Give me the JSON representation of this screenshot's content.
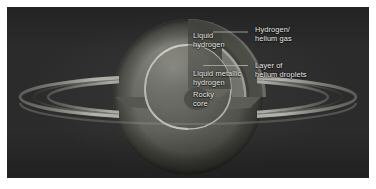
{
  "figure": {
    "background_color": "#ffffff",
    "plate_color": "#2b2b2b",
    "label_color": "#e9e9e6",
    "leader_line_color": "#d8d8d4"
  },
  "labels": {
    "liquid_hydrogen": "Liquid\nhydrogen",
    "hydrogen_helium_gas": "Hydrogen/\nhelium gas",
    "helium_droplets": "Layer of\nhelium droplets",
    "liquid_metallic_hydrogen": "Liquid metallic\nhydrogen",
    "rocky_core": "Rocky\ncore"
  },
  "diagram": {
    "planet_name": "Saturn",
    "layers": [
      {
        "name": "Hydrogen/helium gas",
        "order": 1,
        "color": "#6e6e68"
      },
      {
        "name": "Liquid hydrogen",
        "order": 2,
        "color": "#565650"
      },
      {
        "name": "Layer of helium droplets",
        "order": 3,
        "color": "#b9b9b0"
      },
      {
        "name": "Liquid metallic hydrogen",
        "order": 4,
        "color": "#8e8e85"
      },
      {
        "name": "Rocky core",
        "order": 5,
        "color": "#5c5c55"
      }
    ],
    "rings": {
      "count": 3,
      "names": [
        "outer ring",
        "ring gap",
        "inner ring"
      ],
      "color": "#c9c9c1"
    }
  }
}
